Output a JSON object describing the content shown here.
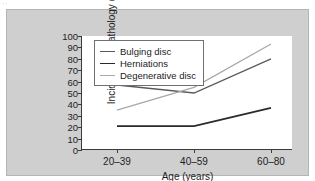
{
  "figure": {
    "corner_mark": "··",
    "background_color": "#cfcfcf",
    "plot_background_color": "#ffffff",
    "axis_color": "#3b3b3b"
  },
  "chart_data": {
    "type": "line",
    "title": "",
    "xlabel": "Age (years)",
    "ylabel": "Incidence of pathology (%)",
    "categories": [
      "20–39",
      "40–59",
      "60–80"
    ],
    "ylim": [
      0,
      100
    ],
    "yticks": [
      0,
      10,
      20,
      30,
      40,
      50,
      60,
      70,
      80,
      90,
      100
    ],
    "grid": false,
    "legend_position": "top-left-inside",
    "series": [
      {
        "name": "Bulging disc",
        "values": [
          57,
          50,
          80
        ],
        "color": "#5a5a5a",
        "width": 1.3
      },
      {
        "name": "Herniations",
        "values": [
          21,
          21,
          37
        ],
        "color": "#2a2a2a",
        "width": 1.7
      },
      {
        "name": "Degenerative disc",
        "values": [
          35,
          55,
          93
        ],
        "color": "#a8a8a8",
        "width": 1.3
      }
    ]
  }
}
